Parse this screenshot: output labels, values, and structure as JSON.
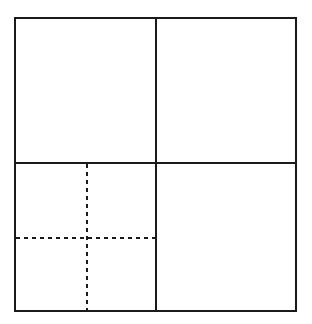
{
  "diagram": {
    "title": "",
    "colors": {
      "background": "#ffffff",
      "stroke": "#1a1a1a"
    },
    "outer_square": {
      "x": 15,
      "y": 18,
      "width": 281,
      "height": 293,
      "stroke_width": 2
    },
    "solid_dividers": [
      {
        "name": "vertical-center-line",
        "x1": 156,
        "y1": 18,
        "x2": 156,
        "y2": 311
      },
      {
        "name": "horizontal-center-line",
        "x1": 15,
        "y1": 163,
        "x2": 296,
        "y2": 163
      }
    ],
    "dashed_dividers": [
      {
        "name": "dashed-vertical-line",
        "x1": 87,
        "y1": 164,
        "x2": 87,
        "y2": 311
      },
      {
        "name": "dashed-horizontal-line",
        "x1": 16,
        "y1": 238,
        "x2": 156,
        "y2": 238
      }
    ],
    "dash_pattern": "4,4",
    "quadrants": [
      {
        "name": "top-left",
        "subdivided": false
      },
      {
        "name": "top-right",
        "subdivided": false
      },
      {
        "name": "bottom-left",
        "subdivided": true,
        "sub_parts": 4
      },
      {
        "name": "bottom-right",
        "subdivided": false
      }
    ]
  }
}
